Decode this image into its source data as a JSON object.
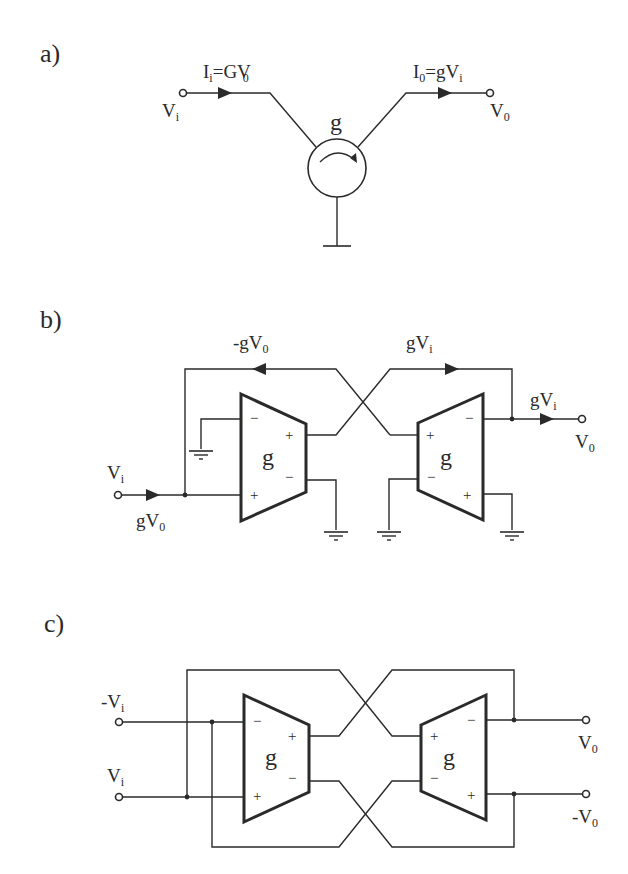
{
  "figure": {
    "background": "#ffffff",
    "ink": "#2a2a2a",
    "panels": [
      {
        "id": "a",
        "label": "a)",
        "element": "gyrator",
        "element_label": "g",
        "input": {
          "name": "V",
          "sub": "i"
        },
        "output": {
          "name": "V",
          "sub": "0"
        },
        "input_current": {
          "name": "I",
          "sub": "i",
          "expr": "=GV",
          "expr_sub": "0"
        },
        "output_current": {
          "name": "I",
          "sub": "0",
          "expr": "=gV",
          "expr_sub": "i"
        }
      },
      {
        "id": "b",
        "label": "b)",
        "element": "two single-ended OTAs",
        "ota_label": "g",
        "input": {
          "name": "V",
          "sub": "i"
        },
        "output": {
          "name": "V",
          "sub": "0"
        },
        "feedback_top_left": {
          "prefix": "-g",
          "name": "V",
          "sub": "0"
        },
        "feedback_top_right": {
          "prefix": "g",
          "name": "V",
          "sub": "i"
        },
        "output_current": {
          "prefix": "g",
          "name": "V",
          "sub": "i"
        },
        "input_current": {
          "prefix": "g",
          "name": "V",
          "sub": "0"
        },
        "pin_signs": {
          "minus": "−",
          "plus": "+"
        }
      },
      {
        "id": "c",
        "label": "c)",
        "element": "two fully-differential OTAs",
        "ota_label": "g",
        "inputs": [
          {
            "prefix": "-",
            "name": "V",
            "sub": "i"
          },
          {
            "prefix": "",
            "name": "V",
            "sub": "i"
          }
        ],
        "outputs": [
          {
            "prefix": "",
            "name": "V",
            "sub": "0"
          },
          {
            "prefix": "-",
            "name": "V",
            "sub": "0"
          }
        ],
        "pin_signs": {
          "minus": "−",
          "plus": "+"
        }
      }
    ]
  }
}
